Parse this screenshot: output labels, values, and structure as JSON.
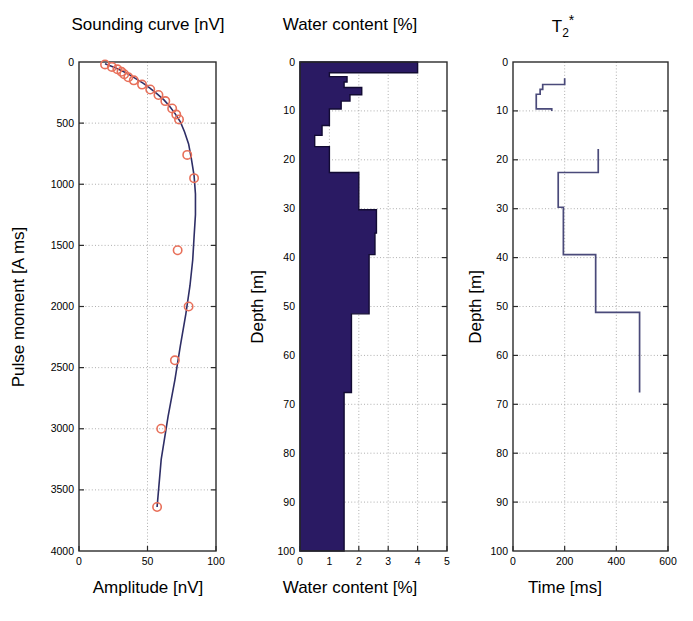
{
  "figure": {
    "width": 693,
    "height": 621,
    "background": "#ffffff",
    "line_color": "#2e2e66",
    "marker_color": "#e8705a",
    "fill_color": "#2a1a63",
    "grid_color": "#9a9a9a"
  },
  "panels": [
    {
      "id": "sounding",
      "title": "Sounding curve [nV]",
      "xlabel": "Amplitude [nV]",
      "ylabel": "Pulse moment [A ms]",
      "xticks": [
        0,
        50,
        100
      ],
      "xtick_labels": [
        "0",
        "50",
        "100"
      ],
      "yticks": [
        0,
        500,
        1000,
        1500,
        2000,
        2500,
        3000,
        3500,
        4000
      ],
      "ytick_labels": [
        "0",
        "500",
        "1000",
        "1500",
        "2000",
        "2500",
        "3000",
        "3500",
        "4000"
      ],
      "xlim": [
        0,
        100
      ],
      "ylim": [
        0,
        4000
      ],
      "y_inverted": true,
      "grid": true
    },
    {
      "id": "water",
      "title": "Water content [%]",
      "xlabel": "Water content [%]",
      "ylabel": "Depth [m]",
      "xticks": [
        0,
        1,
        2,
        3,
        4,
        5
      ],
      "xtick_labels": [
        "0",
        "1",
        "2",
        "3",
        "4",
        "5"
      ],
      "yticks": [
        0,
        10,
        20,
        30,
        40,
        50,
        60,
        70,
        80,
        90,
        100
      ],
      "ytick_labels": [
        "0",
        "10",
        "20",
        "30",
        "40",
        "50",
        "60",
        "70",
        "80",
        "90",
        "100"
      ],
      "xlim": [
        0,
        5
      ],
      "ylim": [
        0,
        100
      ],
      "y_inverted": true,
      "grid": true
    },
    {
      "id": "t2star",
      "title": "T2*",
      "title_base": "T",
      "title_sub": "2",
      "title_sup": "*",
      "xlabel": "Time [ms]",
      "ylabel": "Depth [m]",
      "xticks": [
        0,
        200,
        400,
        600
      ],
      "xtick_labels": [
        "0",
        "200",
        "400",
        "600"
      ],
      "yticks": [
        0,
        10,
        20,
        30,
        40,
        50,
        60,
        70,
        80,
        90,
        100
      ],
      "ytick_labels": [
        "0",
        "10",
        "20",
        "30",
        "40",
        "50",
        "60",
        "70",
        "80",
        "90",
        "100"
      ],
      "xlim": [
        0,
        600
      ],
      "ylim": [
        0,
        100
      ],
      "y_inverted": true,
      "grid": true
    }
  ],
  "chart_data": [
    {
      "type": "scatter",
      "id": "sounding-curve",
      "title": "Sounding curve [nV]",
      "xlabel": "Amplitude [nV]",
      "ylabel": "Pulse moment [A ms]",
      "xlim": [
        0,
        100
      ],
      "ylim": [
        0,
        4000
      ],
      "y_inverted": true,
      "grid": true,
      "series": [
        {
          "name": "measured data",
          "style": "open-circle-marker",
          "color": "#e8705a",
          "x": [
            19,
            24,
            28,
            31,
            33,
            36,
            40,
            46,
            52,
            58,
            63,
            68,
            71,
            73,
            79,
            84,
            80,
            72,
            70,
            60,
            57
          ],
          "y": [
            20,
            40,
            60,
            80,
            100,
            125,
            150,
            185,
            225,
            270,
            320,
            380,
            430,
            470,
            760,
            950,
            2000,
            1540,
            2440,
            3000,
            3640
          ]
        },
        {
          "name": "fitted model",
          "style": "line",
          "color": "#2e2e66",
          "x": [
            19,
            26,
            32,
            37,
            42,
            47,
            52,
            57,
            62,
            66,
            70,
            74,
            77,
            80,
            82,
            84,
            85,
            85,
            84,
            83,
            81,
            78,
            74,
            70,
            65,
            60,
            57
          ],
          "y": [
            15,
            45,
            75,
            105,
            140,
            175,
            215,
            260,
            310,
            360,
            420,
            490,
            570,
            670,
            790,
            930,
            1080,
            1250,
            1430,
            1620,
            1830,
            2060,
            2320,
            2600,
            2900,
            3250,
            3640
          ]
        }
      ]
    },
    {
      "type": "area",
      "id": "water-content-profile",
      "title": "Water content [%]",
      "xlabel": "Water content [%]",
      "ylabel": "Depth [m]",
      "xlim": [
        0,
        5
      ],
      "ylim": [
        0,
        100
      ],
      "y_inverted": true,
      "grid": true,
      "orientation": "horizontal-steps",
      "color": "#2a1a63",
      "layers": [
        {
          "top": 0.0,
          "bottom": 2.2,
          "value": 4.0
        },
        {
          "top": 2.2,
          "bottom": 3.0,
          "value": 1.0
        },
        {
          "top": 3.0,
          "bottom": 4.1,
          "value": 1.6
        },
        {
          "top": 4.1,
          "bottom": 5.2,
          "value": 1.5
        },
        {
          "top": 5.2,
          "bottom": 6.7,
          "value": 2.1
        },
        {
          "top": 6.7,
          "bottom": 8.0,
          "value": 1.7
        },
        {
          "top": 8.0,
          "bottom": 9.6,
          "value": 1.4
        },
        {
          "top": 9.6,
          "bottom": 13.0,
          "value": 1.0
        },
        {
          "top": 13.0,
          "bottom": 15.0,
          "value": 0.75
        },
        {
          "top": 15.0,
          "bottom": 17.3,
          "value": 0.5
        },
        {
          "top": 17.3,
          "bottom": 22.6,
          "value": 1.0
        },
        {
          "top": 22.6,
          "bottom": 30.2,
          "value": 2.0
        },
        {
          "top": 30.2,
          "bottom": 35.0,
          "value": 2.6
        },
        {
          "top": 35.0,
          "bottom": 39.4,
          "value": 2.55
        },
        {
          "top": 39.4,
          "bottom": 51.5,
          "value": 2.35
        },
        {
          "top": 51.5,
          "bottom": 67.6,
          "value": 1.75
        },
        {
          "top": 67.6,
          "bottom": 100.0,
          "value": 1.5
        }
      ]
    },
    {
      "type": "line",
      "id": "t2star-profile",
      "title": "T2*",
      "xlabel": "Time [ms]",
      "ylabel": "Depth [m]",
      "xlim": [
        0,
        600
      ],
      "ylim": [
        0,
        100
      ],
      "y_inverted": true,
      "grid": true,
      "orientation": "horizontal-steps",
      "color": "#4a4a7a",
      "layers": [
        {
          "top": 3.3,
          "bottom": 4.6,
          "value": 200
        },
        {
          "top": 4.6,
          "bottom": 5.6,
          "value": 115
        },
        {
          "top": 5.6,
          "bottom": 6.6,
          "value": 105
        },
        {
          "top": 6.6,
          "bottom": 9.6,
          "value": 90
        },
        {
          "top": 9.6,
          "bottom": 10.0,
          "value": 150
        },
        {
          "top": 17.8,
          "bottom": 22.6,
          "value": 330
        },
        {
          "top": 22.6,
          "bottom": 29.7,
          "value": 175
        },
        {
          "top": 29.7,
          "bottom": 39.4,
          "value": 195
        },
        {
          "top": 39.4,
          "bottom": 51.2,
          "value": 320
        },
        {
          "top": 51.2,
          "bottom": 67.6,
          "value": 490
        }
      ]
    }
  ]
}
